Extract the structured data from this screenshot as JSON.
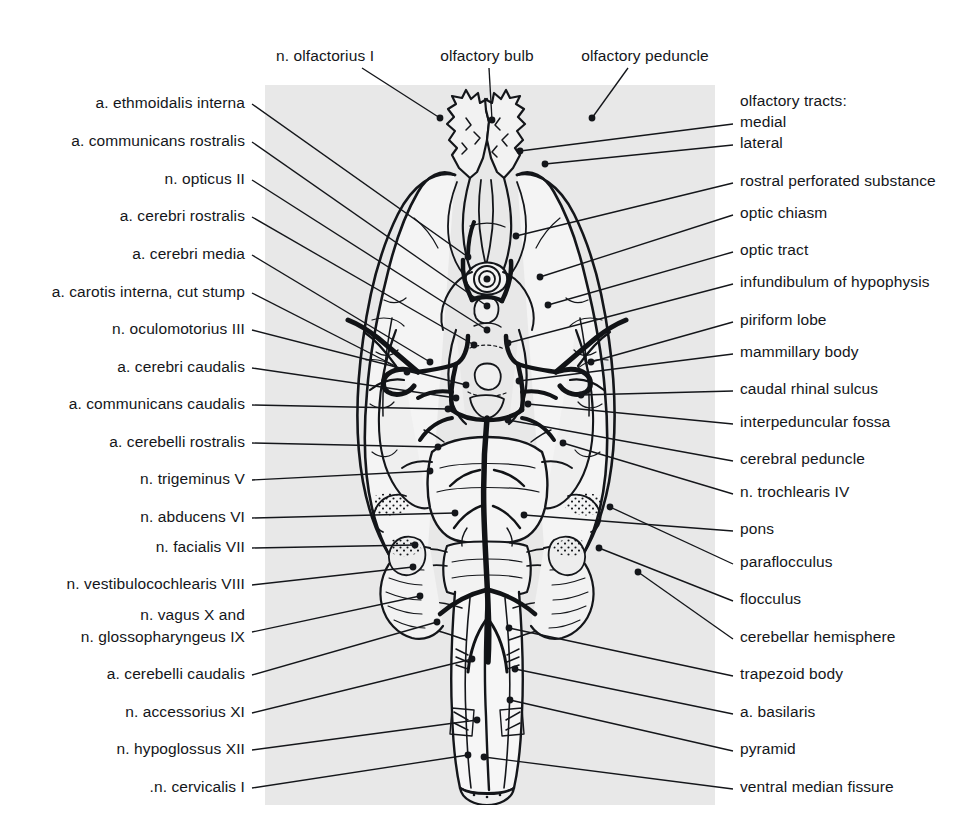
{
  "figure": {
    "plate_color": "#e8e8e8",
    "ink_color": "#14161a",
    "width": 961,
    "height": 838
  },
  "top_labels": [
    {
      "text": "n. olfactorius I",
      "x": 325,
      "y": 56,
      "leader": [
        [
          362,
          68
        ],
        [
          440,
          118
        ]
      ]
    },
    {
      "text": "olfactory bulb",
      "x": 487,
      "y": 56,
      "leader": [
        [
          489,
          68
        ],
        [
          492,
          120
        ]
      ]
    },
    {
      "text": "olfactory peduncle",
      "x": 645,
      "y": 56,
      "leader": [
        [
          628,
          68
        ],
        [
          592,
          118
        ]
      ]
    }
  ],
  "left_labels": [
    {
      "text": "a. ethmoidalis interna",
      "y": 102,
      "leader": [
        [
          252,
          104
        ],
        [
          468,
          257
        ]
      ]
    },
    {
      "text": "a. communicans rostralis",
      "y": 140,
      "leader": [
        [
          252,
          142
        ],
        [
          487,
          306
        ]
      ]
    },
    {
      "text": "n. opticus II",
      "y": 178,
      "leader": [
        [
          252,
          180
        ],
        [
          487,
          330
        ]
      ]
    },
    {
      "text": "a. cerebri rostralis",
      "y": 215,
      "leader": [
        [
          252,
          217
        ],
        [
          474,
          345
        ]
      ]
    },
    {
      "text": "a. cerebri media",
      "y": 253,
      "leader": [
        [
          252,
          255
        ],
        [
          430,
          362
        ]
      ]
    },
    {
      "text": "a. carotis interna, cut stump",
      "y": 291,
      "leader": [
        [
          252,
          293
        ],
        [
          407,
          372
        ]
      ]
    },
    {
      "text": "n. oculomotorius III",
      "y": 328,
      "leader": [
        [
          252,
          330
        ],
        [
          466,
          385
        ]
      ]
    },
    {
      "text": "a. cerebri caudalis",
      "y": 366,
      "leader": [
        [
          252,
          368
        ],
        [
          456,
          398
        ]
      ]
    },
    {
      "text": "a. communicans caudalis",
      "y": 403,
      "leader": [
        [
          252,
          405
        ],
        [
          448,
          409
        ]
      ]
    },
    {
      "text": "a. cerebelli rostralis",
      "y": 441,
      "leader": [
        [
          252,
          443
        ],
        [
          438,
          447
        ]
      ]
    },
    {
      "text": "n. trigeminus V",
      "y": 478,
      "leader": [
        [
          252,
          480
        ],
        [
          430,
          471
        ]
      ]
    },
    {
      "text": "n. abducens VI",
      "y": 516,
      "leader": [
        [
          252,
          518
        ],
        [
          455,
          513
        ]
      ]
    },
    {
      "text": "n. facialis VII",
      "y": 546,
      "leader": [
        [
          252,
          548
        ],
        [
          415,
          545
        ]
      ]
    },
    {
      "text": "n. vestibulocochlearis VIII",
      "y": 583,
      "leader": [
        [
          252,
          585
        ],
        [
          413,
          567
        ]
      ]
    },
    {
      "text": "n. vagus X and",
      "y": 614,
      "leader": null
    },
    {
      "text": "n. glossopharyngeus IX",
      "y": 636,
      "leader": [
        [
          252,
          632
        ],
        [
          420,
          596
        ]
      ]
    },
    {
      "text": "a. cerebelli caudalis",
      "y": 673,
      "leader": [
        [
          252,
          675
        ],
        [
          437,
          622
        ]
      ]
    },
    {
      "text": "n. accessorius XI",
      "y": 711,
      "leader": [
        [
          252,
          713
        ],
        [
          472,
          659
        ]
      ]
    },
    {
      "text": "n. hypoglossus XII",
      "y": 748,
      "leader": [
        [
          252,
          750
        ],
        [
          477,
          720
        ]
      ]
    },
    {
      "text": ".n. cervicalis I",
      "y": 786,
      "leader": [
        [
          252,
          788
        ],
        [
          468,
          755
        ]
      ]
    }
  ],
  "right_labels": [
    {
      "text": "olfactory tracts:",
      "y": 100,
      "leader": null,
      "block": true
    },
    {
      "text": "medial",
      "y": 121,
      "leader": [
        [
          733,
          124
        ],
        [
          520,
          151
        ]
      ]
    },
    {
      "text": "lateral",
      "y": 142,
      "leader": [
        [
          733,
          145
        ],
        [
          545,
          164
        ]
      ]
    },
    {
      "text": "rostral perforated substance",
      "y": 180,
      "leader": [
        [
          733,
          183
        ],
        [
          516,
          236
        ]
      ]
    },
    {
      "text": "optic chiasm",
      "y": 212,
      "leader": [
        [
          733,
          215
        ],
        [
          540,
          277
        ]
      ]
    },
    {
      "text": "optic tract",
      "y": 249,
      "leader": [
        [
          733,
          252
        ],
        [
          548,
          305
        ]
      ]
    },
    {
      "text": "infundibulum of hypophysis",
      "y": 281,
      "leader": [
        [
          733,
          284
        ],
        [
          508,
          343
        ]
      ]
    },
    {
      "text": "piriform lobe",
      "y": 319,
      "leader": [
        [
          733,
          322
        ],
        [
          591,
          362
        ]
      ]
    },
    {
      "text": "mammillary body",
      "y": 351,
      "leader": [
        [
          733,
          354
        ],
        [
          519,
          381
        ]
      ]
    },
    {
      "text": "caudal rhinal sulcus",
      "y": 388,
      "leader": [
        [
          733,
          391
        ],
        [
          581,
          395
        ]
      ]
    },
    {
      "text": "interpeduncular fossa",
      "y": 421,
      "leader": [
        [
          733,
          424
        ],
        [
          528,
          404
        ]
      ]
    },
    {
      "text": "cerebral peduncle",
      "y": 458,
      "leader": [
        [
          733,
          461
        ],
        [
          508,
          420
        ]
      ]
    },
    {
      "text": "n. trochlearis IV",
      "y": 491,
      "leader": [
        [
          733,
          494
        ],
        [
          563,
          443
        ]
      ]
    },
    {
      "text": "pons",
      "y": 528,
      "leader": [
        [
          733,
          531
        ],
        [
          524,
          515
        ]
      ]
    },
    {
      "text": "paraflocculus",
      "y": 561,
      "leader": [
        [
          733,
          564
        ],
        [
          610,
          507
        ]
      ]
    },
    {
      "text": "flocculus",
      "y": 598,
      "leader": [
        [
          733,
          601
        ],
        [
          599,
          548
        ]
      ]
    },
    {
      "text": "cerebellar hemisphere",
      "y": 636,
      "leader": [
        [
          733,
          639
        ],
        [
          638,
          572
        ]
      ]
    },
    {
      "text": "trapezoid body",
      "y": 673,
      "leader": [
        [
          733,
          676
        ],
        [
          509,
          628
        ]
      ]
    },
    {
      "text": "a. basilaris",
      "y": 711,
      "leader": [
        [
          733,
          714
        ],
        [
          515,
          669
        ]
      ]
    },
    {
      "text": "pyramid",
      "y": 748,
      "leader": [
        [
          733,
          751
        ],
        [
          510,
          700
        ]
      ]
    },
    {
      "text": "ventral median fissure",
      "y": 786,
      "leader": [
        [
          733,
          789
        ],
        [
          484,
          757
        ]
      ]
    }
  ],
  "anatomy": {
    "description": "Line drawing of the ventral surface of a carnivore brain showing cerebral hemispheres, olfactory bulbs and peduncles, optic chiasm and tracts, hypophysial infundibulum, piriform lobes, cerebral peduncles, pons, trapezoid body, medulla with pyramids, cerebellar hemispheres with paraflocculus and flocculus, and the arterial circle with basilar artery.",
    "pointer_dots": [
      [
        468,
        257
      ],
      [
        487,
        306
      ],
      [
        487,
        330
      ],
      [
        474,
        345
      ],
      [
        430,
        362
      ],
      [
        407,
        372
      ],
      [
        466,
        385
      ],
      [
        456,
        398
      ],
      [
        448,
        409
      ],
      [
        438,
        447
      ],
      [
        430,
        471
      ],
      [
        455,
        513
      ],
      [
        415,
        545
      ],
      [
        413,
        567
      ],
      [
        420,
        596
      ],
      [
        437,
        622
      ],
      [
        472,
        659
      ],
      [
        477,
        720
      ],
      [
        468,
        755
      ],
      [
        520,
        151
      ],
      [
        545,
        164
      ],
      [
        516,
        236
      ],
      [
        540,
        277
      ],
      [
        548,
        305
      ],
      [
        508,
        343
      ],
      [
        591,
        362
      ],
      [
        519,
        381
      ],
      [
        581,
        395
      ],
      [
        528,
        404
      ],
      [
        508,
        420
      ],
      [
        563,
        443
      ],
      [
        524,
        515
      ],
      [
        610,
        507
      ],
      [
        599,
        548
      ],
      [
        638,
        572
      ],
      [
        509,
        628
      ],
      [
        515,
        669
      ],
      [
        510,
        700
      ],
      [
        484,
        757
      ]
    ]
  }
}
